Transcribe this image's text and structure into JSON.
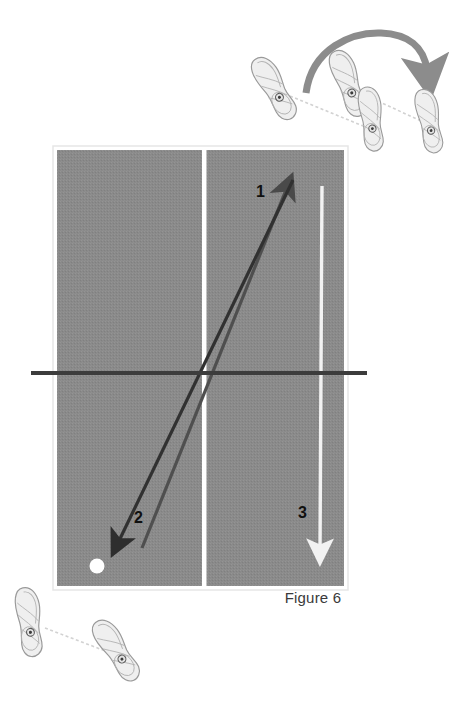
{
  "figure": {
    "caption": "Figure 6",
    "background_color": "#ffffff"
  },
  "table": {
    "name": "table-tennis-table",
    "surface_color": "#8a8a8a",
    "border_color": "#ffffff",
    "x": 55,
    "y": 148,
    "width": 291,
    "height": 440,
    "center_line": {
      "name": "center-line",
      "color": "#ffffff",
      "x": 204,
      "width": 4
    },
    "net_line": {
      "name": "net-line",
      "color": "#3c3c3c",
      "y": 373,
      "x1": 31,
      "x2": 367,
      "thickness": 4
    }
  },
  "ball": {
    "name": "ball",
    "color": "#ffffff",
    "cx": 97,
    "cy": 566,
    "r": 7
  },
  "arrows": [
    {
      "id": 1,
      "label": "1",
      "name": "arrow-1-forward-stroke",
      "color": "#4a4a4a",
      "direction": "up-right",
      "x1": 142,
      "y1": 545,
      "x2": 289,
      "y2": 181,
      "label_x": 256,
      "label_y": 183
    },
    {
      "id": 2,
      "label": "2",
      "name": "arrow-2-return-recovery",
      "color": "#2e2e2e",
      "direction": "down-left",
      "x1": 294,
      "y1": 177,
      "x2": 115,
      "y2": 547,
      "label_x": 134,
      "label_y": 509
    },
    {
      "id": 3,
      "label": "3",
      "name": "arrow-3-white-path",
      "color": "#f2f2f2",
      "direction": "down",
      "x1": 322,
      "y1": 185,
      "x2": 320,
      "y2": 556,
      "label_x": 298,
      "label_y": 504
    }
  ],
  "footwork_top": {
    "name": "footwork-group-top",
    "arc": {
      "name": "pivot-arc-arrow",
      "color": "#8c8c8c",
      "direction": "clockwise-over-top"
    },
    "feet": [
      {
        "name": "foot-top-left-rear",
        "cx": 275,
        "cy": 88,
        "rotation": -35,
        "outline_color": "#9a9a9a",
        "fill_color": "#efefef"
      },
      {
        "name": "foot-top-mid-front",
        "cx": 349,
        "cy": 83,
        "rotation": -25,
        "outline_color": "#9a9a9a",
        "fill_color": "#efefef"
      },
      {
        "name": "foot-top-mid-rear",
        "cx": 372,
        "cy": 119,
        "rotation": -15,
        "outline_color": "#9a9a9a",
        "fill_color": "#efefef"
      },
      {
        "name": "foot-top-right",
        "cx": 430,
        "cy": 121,
        "rotation": -18,
        "outline_color": "#9a9a9a",
        "fill_color": "#efefef"
      }
    ],
    "connector_color": "#d2d2d2"
  },
  "footwork_bottom": {
    "name": "footwork-group-bottom",
    "feet": [
      {
        "name": "foot-bottom-left",
        "cx": 30,
        "cy": 622,
        "rotation": -12,
        "outline_color": "#9a9a9a",
        "fill_color": "#efefef"
      },
      {
        "name": "foot-bottom-right",
        "cx": 117,
        "cy": 650,
        "rotation": -35,
        "outline_color": "#9a9a9a",
        "fill_color": "#efefef"
      }
    ],
    "connector_color": "#d2d2d2"
  }
}
